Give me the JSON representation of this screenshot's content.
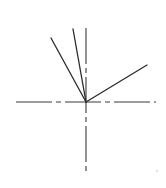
{
  "diagram": {
    "type": "angle-construction",
    "origin": {
      "x": 86,
      "y": 102
    },
    "axes": {
      "color": "#3a3a3a",
      "style": "dash-dot",
      "horizontal": {
        "x1": 16,
        "y1": 102,
        "x2": 156,
        "y2": 102
      },
      "vertical": {
        "x1": 86,
        "y1": 28,
        "x2": 86,
        "y2": 175
      }
    },
    "rays": [
      {
        "name": "ray-left",
        "x1": 86,
        "y1": 102,
        "x2": 51,
        "y2": 38,
        "color": "#2a2a2a"
      },
      {
        "name": "ray-middle",
        "x1": 86,
        "y1": 102,
        "x2": 73,
        "y2": 29,
        "color": "#2a2a2a"
      },
      {
        "name": "ray-right",
        "x1": 86,
        "y1": 102,
        "x2": 147,
        "y2": 65,
        "color": "#2a2a2a"
      }
    ],
    "marks": [
      {
        "name": "stray-dot",
        "x": 157,
        "y": 171,
        "color": "#bdbdbd"
      }
    ]
  }
}
